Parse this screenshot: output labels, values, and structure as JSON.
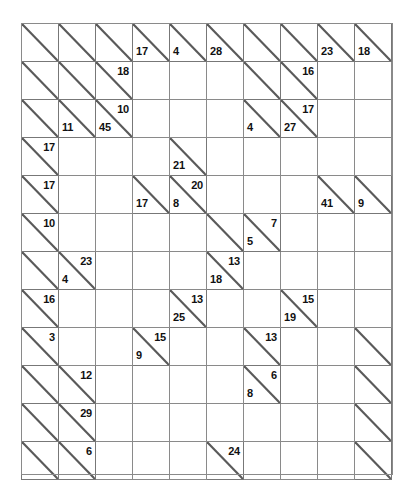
{
  "puzzle": {
    "name": "kakuro-grid",
    "type": "kakuro",
    "columns": 10,
    "rows": 12,
    "colors": {
      "clue_cell": "#c9c9c9",
      "entry_cell": "#ffffff",
      "grid_line": "#8a8a8a",
      "text": "#111111",
      "page_background": "#ffffff"
    },
    "cells": [
      [
        {
          "t": "clue",
          "right": "",
          "down": ""
        },
        {
          "t": "clue",
          "right": "",
          "down": ""
        },
        {
          "t": "clue",
          "right": "",
          "down": ""
        },
        {
          "t": "clue",
          "right": "",
          "down": "17"
        },
        {
          "t": "clue",
          "right": "",
          "down": "4"
        },
        {
          "t": "clue",
          "right": "",
          "down": "28"
        },
        {
          "t": "clue",
          "right": "",
          "down": ""
        },
        {
          "t": "clue",
          "right": "",
          "down": ""
        },
        {
          "t": "clue",
          "right": "",
          "down": "23"
        },
        {
          "t": "clue",
          "right": "",
          "down": "18"
        }
      ],
      [
        {
          "t": "clue",
          "right": "",
          "down": ""
        },
        {
          "t": "clue",
          "right": "",
          "down": ""
        },
        {
          "t": "clue",
          "right": "18",
          "down": ""
        },
        {
          "t": "blank"
        },
        {
          "t": "blank"
        },
        {
          "t": "blank"
        },
        {
          "t": "clue",
          "right": "",
          "down": ""
        },
        {
          "t": "clue",
          "right": "16",
          "down": ""
        },
        {
          "t": "blank"
        },
        {
          "t": "blank"
        }
      ],
      [
        {
          "t": "clue",
          "right": "",
          "down": ""
        },
        {
          "t": "clue",
          "right": "",
          "down": "11"
        },
        {
          "t": "clue",
          "right": "10",
          "down": "45"
        },
        {
          "t": "blank"
        },
        {
          "t": "blank"
        },
        {
          "t": "blank"
        },
        {
          "t": "clue",
          "right": "",
          "down": "4"
        },
        {
          "t": "clue",
          "right": "17",
          "down": "27"
        },
        {
          "t": "blank"
        },
        {
          "t": "blank"
        }
      ],
      [
        {
          "t": "clue",
          "right": "17",
          "down": ""
        },
        {
          "t": "blank"
        },
        {
          "t": "blank"
        },
        {
          "t": "blank"
        },
        {
          "t": "clue",
          "right": "",
          "down": "21"
        },
        {
          "t": "blank"
        },
        {
          "t": "blank"
        },
        {
          "t": "blank"
        },
        {
          "t": "blank"
        },
        {
          "t": "blank"
        }
      ],
      [
        {
          "t": "clue",
          "right": "17",
          "down": ""
        },
        {
          "t": "blank"
        },
        {
          "t": "blank"
        },
        {
          "t": "clue",
          "right": "",
          "down": "17"
        },
        {
          "t": "clue",
          "right": "20",
          "down": "8"
        },
        {
          "t": "blank"
        },
        {
          "t": "blank"
        },
        {
          "t": "blank"
        },
        {
          "t": "clue",
          "right": "",
          "down": "41"
        },
        {
          "t": "clue",
          "right": "",
          "down": "9"
        }
      ],
      [
        {
          "t": "clue",
          "right": "10",
          "down": ""
        },
        {
          "t": "blank"
        },
        {
          "t": "blank"
        },
        {
          "t": "blank"
        },
        {
          "t": "blank"
        },
        {
          "t": "clue",
          "right": "",
          "down": ""
        },
        {
          "t": "clue",
          "right": "7",
          "down": "5"
        },
        {
          "t": "blank"
        },
        {
          "t": "blank"
        },
        {
          "t": "blank"
        }
      ],
      [
        {
          "t": "clue",
          "right": "",
          "down": ""
        },
        {
          "t": "clue",
          "right": "23",
          "down": "4"
        },
        {
          "t": "blank"
        },
        {
          "t": "blank"
        },
        {
          "t": "blank"
        },
        {
          "t": "clue",
          "right": "13",
          "down": "18"
        },
        {
          "t": "blank"
        },
        {
          "t": "blank"
        },
        {
          "t": "blank"
        },
        {
          "t": "blank"
        }
      ],
      [
        {
          "t": "clue",
          "right": "16",
          "down": ""
        },
        {
          "t": "blank"
        },
        {
          "t": "blank"
        },
        {
          "t": "blank"
        },
        {
          "t": "clue",
          "right": "13",
          "down": "25"
        },
        {
          "t": "blank"
        },
        {
          "t": "blank"
        },
        {
          "t": "clue",
          "right": "15",
          "down": "19"
        },
        {
          "t": "blank"
        },
        {
          "t": "blank"
        }
      ],
      [
        {
          "t": "clue",
          "right": "3",
          "down": ""
        },
        {
          "t": "blank"
        },
        {
          "t": "blank"
        },
        {
          "t": "clue",
          "right": "15",
          "down": "9"
        },
        {
          "t": "blank"
        },
        {
          "t": "blank"
        },
        {
          "t": "clue",
          "right": "13",
          "down": ""
        },
        {
          "t": "blank"
        },
        {
          "t": "blank"
        },
        {
          "t": "clue",
          "right": "",
          "down": ""
        }
      ],
      [
        {
          "t": "clue",
          "right": "",
          "down": ""
        },
        {
          "t": "clue",
          "right": "12",
          "down": ""
        },
        {
          "t": "blank"
        },
        {
          "t": "blank"
        },
        {
          "t": "blank"
        },
        {
          "t": "blank"
        },
        {
          "t": "clue",
          "right": "6",
          "down": "8"
        },
        {
          "t": "blank"
        },
        {
          "t": "blank"
        },
        {
          "t": "clue",
          "right": "",
          "down": ""
        }
      ],
      [
        {
          "t": "clue",
          "right": "",
          "down": ""
        },
        {
          "t": "clue",
          "right": "29",
          "down": ""
        },
        {
          "t": "blank"
        },
        {
          "t": "blank"
        },
        {
          "t": "blank"
        },
        {
          "t": "blank"
        },
        {
          "t": "blank"
        },
        {
          "t": "blank"
        },
        {
          "t": "blank"
        },
        {
          "t": "clue",
          "right": "",
          "down": ""
        }
      ],
      [
        {
          "t": "clue",
          "right": "",
          "down": ""
        },
        {
          "t": "clue",
          "right": "6",
          "down": ""
        },
        {
          "t": "blank"
        },
        {
          "t": "blank"
        },
        {
          "t": "blank"
        },
        {
          "t": "clue",
          "right": "24",
          "down": ""
        },
        {
          "t": "blank"
        },
        {
          "t": "blank"
        },
        {
          "t": "blank"
        },
        {
          "t": "clue",
          "right": "",
          "down": ""
        }
      ]
    ]
  }
}
